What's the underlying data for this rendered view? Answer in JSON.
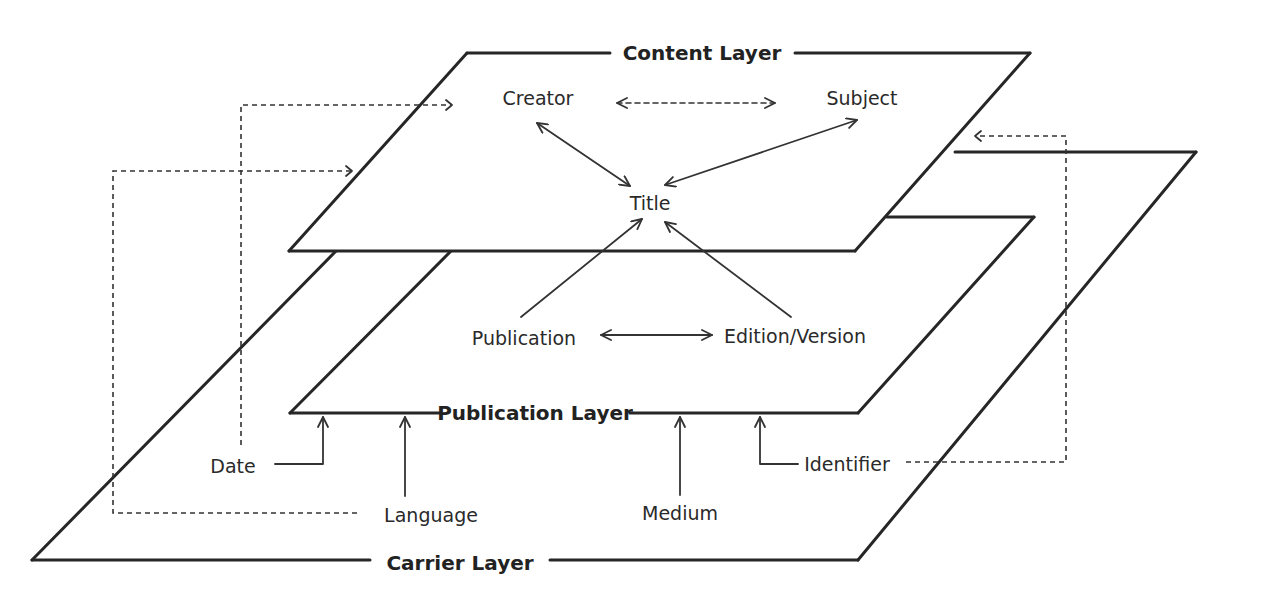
{
  "diagram": {
    "layers": {
      "content": "Content Layer",
      "publication": "Publication Layer",
      "carrier": "Carrier Layer"
    },
    "nodes": {
      "creator": "Creator",
      "subject": "Subject",
      "title": "Title",
      "publication": "Publication",
      "edition": "Edition/Version",
      "date": "Date",
      "language": "Language",
      "medium": "Medium",
      "identifier": "Identifier"
    },
    "relations": [
      {
        "from": "Creator",
        "to": "Subject",
        "style": "dashed",
        "direction": "both"
      },
      {
        "from": "Creator",
        "to": "Title",
        "style": "solid",
        "direction": "both"
      },
      {
        "from": "Subject",
        "to": "Title",
        "style": "solid",
        "direction": "both"
      },
      {
        "from": "Publication",
        "to": "Title",
        "style": "solid",
        "direction": "to"
      },
      {
        "from": "Edition/Version",
        "to": "Title",
        "style": "solid",
        "direction": "to"
      },
      {
        "from": "Publication",
        "to": "Edition/Version",
        "style": "solid",
        "direction": "both"
      },
      {
        "from": "Date",
        "to": "Publication Layer",
        "style": "solid",
        "direction": "to"
      },
      {
        "from": "Language",
        "to": "Publication Layer",
        "style": "solid",
        "direction": "to"
      },
      {
        "from": "Medium",
        "to": "Publication Layer",
        "style": "solid",
        "direction": "to"
      },
      {
        "from": "Identifier",
        "to": "Publication Layer",
        "style": "solid",
        "direction": "to"
      },
      {
        "from": "Date",
        "to": "Content Layer",
        "style": "dashed",
        "direction": "to"
      },
      {
        "from": "Language",
        "to": "Content Layer",
        "style": "dashed",
        "direction": "to"
      },
      {
        "from": "Identifier",
        "to": "Content Layer",
        "style": "dashed",
        "direction": "to"
      }
    ],
    "colors": {
      "line": "#262626",
      "background": "#ffffff"
    }
  }
}
